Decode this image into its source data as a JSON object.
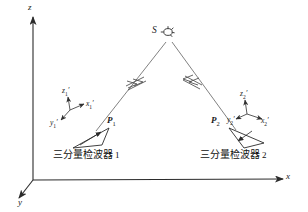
{
  "figure": {
    "background_color": "#ffffff",
    "line_color": "#2b2b2b",
    "ray_color": "#6a6a6a",
    "width": 308,
    "height": 212
  },
  "axes": {
    "x_label": "x",
    "y_label": "y",
    "z_label": "z",
    "origin": "O"
  },
  "source": {
    "label": "S",
    "symbol_name": "explosion-source-symbol"
  },
  "rays": [
    {
      "name": "ray-left",
      "from": "S",
      "to": "P1",
      "marker": "double-tick"
    },
    {
      "name": "ray-right",
      "from": "S",
      "to": "P2",
      "marker": "double-tick"
    }
  ],
  "stations": [
    {
      "point_label": "P",
      "point_index": "1",
      "caption": "三分量检波器",
      "caption_index": "1",
      "triad": {
        "z_label": "z",
        "z_index": "1",
        "x_label": "x",
        "x_index": "1",
        "y_label": "y",
        "y_index": "1",
        "prime": "′"
      }
    },
    {
      "point_label": "P",
      "point_index": "2",
      "caption": "三分量检波器",
      "caption_index": "2",
      "triad": {
        "z_label": "z",
        "z_index": "2",
        "x_label": "x",
        "x_index": "2",
        "y_label": "y",
        "y_index": "2",
        "prime": "′"
      }
    }
  ]
}
